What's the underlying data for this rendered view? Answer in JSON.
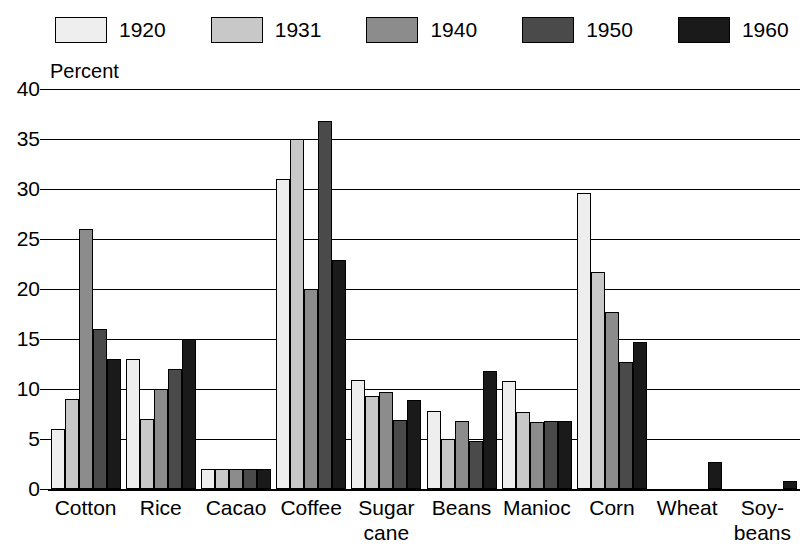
{
  "chart_data": {
    "type": "bar",
    "title": "",
    "subtitle": "",
    "ylabel": "Percent",
    "xlabel": "",
    "ylim": [
      0,
      40
    ],
    "yticks": [
      0,
      5,
      10,
      15,
      20,
      25,
      30,
      35,
      40
    ],
    "grid": true,
    "legend_position": "top",
    "orientation": "vertical",
    "grouping": "clustered",
    "categories": [
      "Cotton",
      "Rice",
      "Cacao",
      "Coffee",
      "Sugar cane",
      "Beans",
      "Manioc",
      "Corn",
      "Wheat",
      "Soybeans"
    ],
    "category_label_lines": [
      [
        "Cotton"
      ],
      [
        "Rice"
      ],
      [
        "Cacao"
      ],
      [
        "Coffee"
      ],
      [
        "Sugar",
        "cane"
      ],
      [
        "Beans"
      ],
      [
        "Manioc"
      ],
      [
        "Corn"
      ],
      [
        "Wheat"
      ],
      [
        "Soy-",
        "beans"
      ]
    ],
    "series": [
      {
        "name": "1920",
        "color": "#eeeeee",
        "values": [
          6.0,
          13.0,
          2.0,
          31.0,
          10.9,
          7.8,
          10.8,
          29.6,
          0,
          0
        ]
      },
      {
        "name": "1931",
        "color": "#c8c8c8",
        "values": [
          9.0,
          7.0,
          2.0,
          35.0,
          9.3,
          5.0,
          7.7,
          21.7,
          0,
          0
        ]
      },
      {
        "name": "1940",
        "color": "#8c8c8c",
        "values": [
          26.0,
          10.0,
          2.0,
          20.0,
          9.7,
          6.8,
          6.7,
          17.7,
          0,
          0
        ]
      },
      {
        "name": "1950",
        "color": "#4a4a4a",
        "values": [
          16.0,
          12.0,
          2.0,
          36.8,
          6.9,
          4.8,
          6.8,
          12.7,
          0,
          0
        ]
      },
      {
        "name": "1960",
        "color": "#1a1a1a",
        "values": [
          13.0,
          15.0,
          2.0,
          22.9,
          8.9,
          11.8,
          6.8,
          14.7,
          2.7,
          0.8
        ]
      }
    ]
  },
  "legend": {
    "items": [
      {
        "label": "1920",
        "color": "#eeeeee"
      },
      {
        "label": "1931",
        "color": "#c8c8c8"
      },
      {
        "label": "1940",
        "color": "#8c8c8c"
      },
      {
        "label": "1950",
        "color": "#4a4a4a"
      },
      {
        "label": "1960",
        "color": "#1a1a1a"
      }
    ]
  },
  "axis": {
    "y_title": "Percent",
    "y_tick_labels": [
      "0",
      "5",
      "10",
      "15",
      "20",
      "25",
      "30",
      "35",
      "40"
    ]
  }
}
